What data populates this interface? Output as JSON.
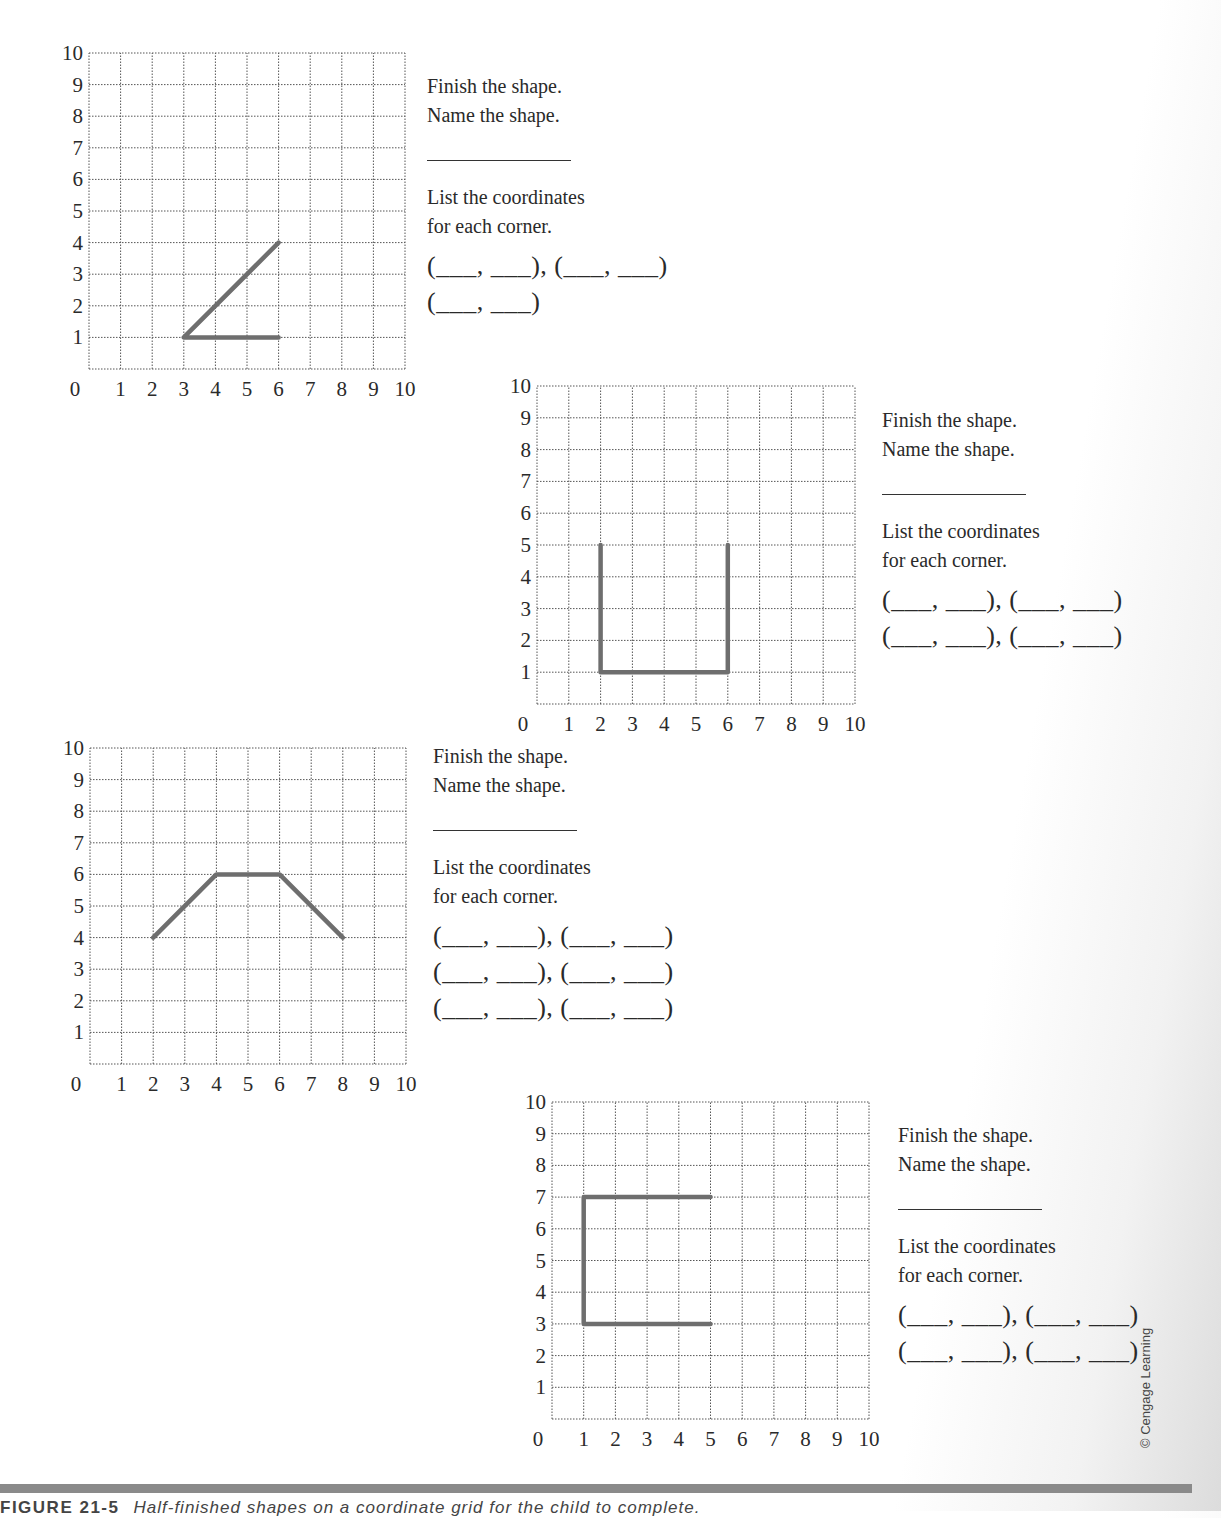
{
  "worksheet": {
    "exercises": [
      {
        "instruction_1": "Finish the shape.",
        "instruction_2": "Name the shape.",
        "instruction_3": "List the coordinates",
        "instruction_4": "for each corner.",
        "coordinate_rows": [
          "(___, ___), (___, ___)",
          "(___, ___)"
        ]
      },
      {
        "instruction_1": "Finish the shape.",
        "instruction_2": "Name the shape.",
        "instruction_3": "List the coordinates",
        "instruction_4": "for each corner.",
        "coordinate_rows": [
          "(___, ___), (___, ___)",
          "(___, ___), (___, ___)"
        ]
      },
      {
        "instruction_1": "Finish the shape.",
        "instruction_2": "Name the shape.",
        "instruction_3": "List the coordinates",
        "instruction_4": "for each corner.",
        "coordinate_rows": [
          "(___, ___), (___, ___)",
          "(___, ___), (___, ___)",
          "(___, ___), (___, ___)"
        ]
      },
      {
        "instruction_1": "Finish the shape.",
        "instruction_2": "Name the shape.",
        "instruction_3": "List the coordinates",
        "instruction_4": "for each corner.",
        "coordinate_rows": [
          "(___, ___), (___, ___)",
          "(___, ___), (___, ___)"
        ]
      }
    ],
    "credit": "© Cengage Learning",
    "caption_label": "FIGURE 21-5",
    "caption_text": "Half-finished shapes on a coordinate grid for the child to complete."
  },
  "grids": [
    {
      "x_ticks": [
        "0",
        "1",
        "2",
        "3",
        "4",
        "5",
        "6",
        "7",
        "8",
        "9",
        "10"
      ],
      "y_ticks": [
        "1",
        "2",
        "3",
        "4",
        "5",
        "6",
        "7",
        "8",
        "9",
        "10"
      ],
      "path": [
        [
          6,
          4
        ],
        [
          3,
          1
        ],
        [
          6,
          1
        ]
      ]
    },
    {
      "x_ticks": [
        "0",
        "1",
        "2",
        "3",
        "4",
        "5",
        "6",
        "7",
        "8",
        "9",
        "10"
      ],
      "y_ticks": [
        "1",
        "2",
        "3",
        "4",
        "5",
        "6",
        "7",
        "8",
        "9",
        "10"
      ],
      "path": [
        [
          2,
          5
        ],
        [
          2,
          1
        ],
        [
          6,
          1
        ],
        [
          6,
          5
        ]
      ]
    },
    {
      "x_ticks": [
        "0",
        "1",
        "2",
        "3",
        "4",
        "5",
        "6",
        "7",
        "8",
        "9",
        "10"
      ],
      "y_ticks": [
        "1",
        "2",
        "3",
        "4",
        "5",
        "6",
        "7",
        "8",
        "9",
        "10"
      ],
      "path": [
        [
          2,
          4
        ],
        [
          4,
          6
        ],
        [
          6,
          6
        ],
        [
          8,
          4
        ]
      ]
    },
    {
      "x_ticks": [
        "0",
        "1",
        "2",
        "3",
        "4",
        "5",
        "6",
        "7",
        "8",
        "9",
        "10"
      ],
      "y_ticks": [
        "1",
        "2",
        "3",
        "4",
        "5",
        "6",
        "7",
        "8",
        "9",
        "10"
      ],
      "path": [
        [
          5,
          7
        ],
        [
          1,
          7
        ],
        [
          1,
          3
        ],
        [
          5,
          3
        ]
      ]
    }
  ],
  "colors": {
    "shape_stroke": "#6e6e6e",
    "grid_line": "#555555",
    "rule": "#8a8a8a"
  }
}
